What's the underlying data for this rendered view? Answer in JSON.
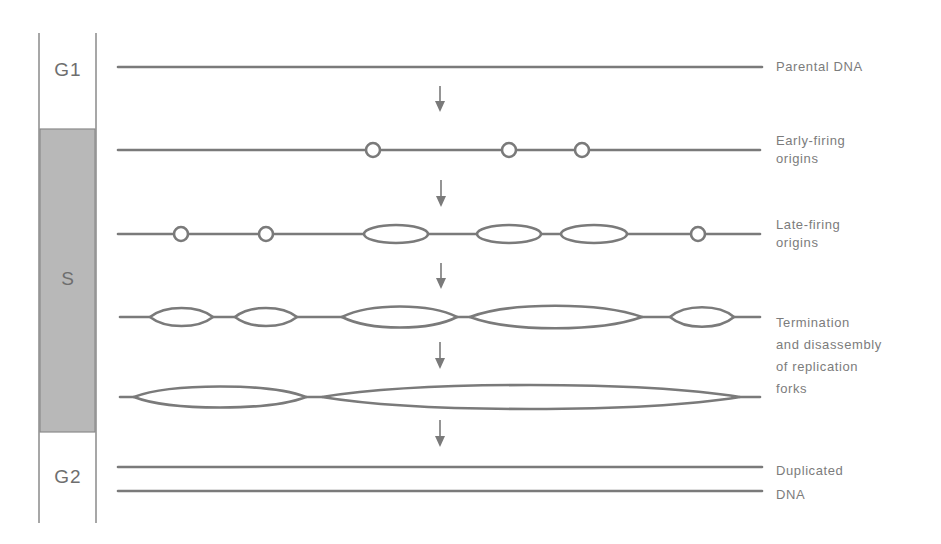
{
  "colors": {
    "line": "#7a7a7a",
    "text": "#7c7c7c",
    "s_phase_fill": "#b8b8b8",
    "background": "#ffffff"
  },
  "phases": [
    {
      "id": "g1",
      "label": "G1"
    },
    {
      "id": "s",
      "label": "S"
    },
    {
      "id": "g2",
      "label": "G2"
    }
  ],
  "stages": [
    {
      "id": "parental",
      "lines": [
        "Parental DNA"
      ]
    },
    {
      "id": "early",
      "lines": [
        "Early-firing",
        "origins"
      ]
    },
    {
      "id": "late",
      "lines": [
        "Late-firing",
        "origins"
      ]
    },
    {
      "id": "termination",
      "lines": [
        "Termination",
        "and disassembly",
        "of  replication",
        "forks"
      ]
    },
    {
      "id": "duplicated",
      "lines": [
        "Duplicated",
        "DNA"
      ]
    }
  ],
  "arrow_icon": "down-arrow-icon",
  "rows": {
    "parental": {
      "y": 67,
      "x1": 118,
      "x2": 762
    },
    "early": {
      "y": 150,
      "origins_x": [
        373,
        509,
        582
      ]
    },
    "late": {
      "y": 234,
      "origins_x": [
        181,
        266,
        698
      ],
      "bubbles": [
        [
          364,
          428
        ],
        [
          477,
          541
        ],
        [
          561,
          627
        ]
      ]
    },
    "termination1": {
      "y": 317,
      "bubbles": [
        [
          150,
          213
        ],
        [
          235,
          297
        ],
        [
          342,
          457
        ],
        [
          470,
          642
        ],
        [
          670,
          734
        ]
      ]
    },
    "termination2": {
      "y": 397,
      "bubbles": [
        [
          134,
          306
        ],
        [
          322,
          740
        ]
      ]
    },
    "duplicated": {
      "y1": 467,
      "y2": 491
    }
  }
}
